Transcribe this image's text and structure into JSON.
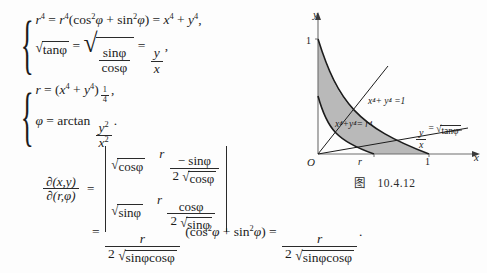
{
  "document": {
    "kind": "math-textbook-page",
    "language": "zh-CN"
  },
  "system1": {
    "brace": "{",
    "line1": {
      "lhs_base": "r",
      "lhs_exp": "4",
      "eq1": "=",
      "rhs1_base": "r",
      "rhs1_exp": "4",
      "paren_open": "(",
      "cos": "cos",
      "cos_exp": "2",
      "phi": "φ",
      "plus": "+",
      "sin": "sin",
      "sin_exp": "2",
      "paren_close": ")",
      "eq2": "=",
      "x": "x",
      "x_exp": "4",
      "plus2": "+",
      "y": "y",
      "y_exp": "4",
      "comma": ","
    },
    "line2": {
      "radicand1": "tanφ",
      "eq1": "=",
      "frac_num": "sinφ",
      "frac_den": "cosφ",
      "eq2": "=",
      "frac2_num": "y",
      "frac2_den": "x",
      "comma": ","
    }
  },
  "system2": {
    "brace": "{",
    "line1": {
      "lhs": "r",
      "eq": "=",
      "paren_open": "(",
      "x": "x",
      "x_exp": "4",
      "plus": "+",
      "y": "y",
      "y_exp": "4",
      "paren_close": ")",
      "outer_exp_num": "1",
      "outer_exp_den": "4",
      "comma": ","
    },
    "line2": {
      "phi": "φ",
      "eq": "=",
      "arctan": "arctan",
      "frac_num_base": "y",
      "frac_num_exp": "2",
      "frac_den_base": "x",
      "frac_den_exp": "2",
      "period": "."
    }
  },
  "jacobian": {
    "lhs": {
      "num_d": "∂",
      "num_args": "(x,y)",
      "den_d": "∂",
      "den_args": "(r,φ)"
    },
    "equals": "=",
    "matrix": {
      "r1c1_radicand": "cosφ",
      "r1c2_coef": "r",
      "r1c2_num": "− sinφ",
      "r1c2_den_coef": "2",
      "r1c2_den_radicand": "cosφ",
      "r2c1_radicand": "sinφ",
      "r2c2_coef": "r",
      "r2c2_num": "cosφ",
      "r2c2_den_coef": "2",
      "r2c2_den_radicand": "sinφ"
    }
  },
  "lastline": {
    "equals1": "=",
    "frac1_num": "r",
    "frac1_den_coef": "2",
    "frac1_den_radicand": "sinφcosφ",
    "paren_open": "(",
    "cos": "cos",
    "cos_exp": "2",
    "phi": "φ",
    "plus": "+",
    "sin": "sin",
    "sin_exp": "2",
    "paren_close": ")",
    "equals2": "=",
    "frac2_num": "r",
    "frac2_den_coef": "2",
    "frac2_den_radicand": "sinφcosφ",
    "period": "."
  },
  "figure": {
    "caption_prefix": "图",
    "caption_number": "10.4.12",
    "axis_y_label": "y",
    "axis_x_label": "x",
    "origin_label": "O",
    "tick_y_1": "1",
    "tick_x_1": "1",
    "tick_x_r": "r",
    "curve_outer_label": "x⁴+ y⁴ =1",
    "curve_inner_label": "x⁴+y⁴= r⁴",
    "ray_label_frac_num": "y",
    "ray_label_frac_den": "x",
    "ray_label_eq": "=",
    "ray_label_radicand": "tanφ",
    "shade_color": "#b9b9b9",
    "stroke_color": "#1c1c1c",
    "axis_color": "#6e6e6e"
  }
}
